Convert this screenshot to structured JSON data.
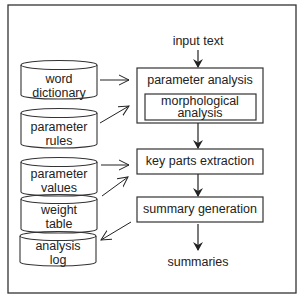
{
  "diagram": {
    "input_label": "input  text",
    "output_label": "summaries",
    "processes": [
      {
        "label": "parameter analysis",
        "sub": "morphological analysis"
      },
      {
        "label": "key parts extraction"
      },
      {
        "label": "summary generation"
      }
    ],
    "stores": [
      {
        "label": "word dictionary"
      },
      {
        "label": "parameter rules"
      },
      {
        "label": "parameter values"
      },
      {
        "label": "weight table"
      },
      {
        "label": "analysis log"
      }
    ],
    "colors": {
      "line": "#333333",
      "background": "#ffffff"
    }
  }
}
